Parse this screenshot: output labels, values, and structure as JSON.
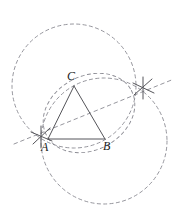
{
  "figure": {
    "width": 177,
    "height": 222,
    "background_color": "#ffffff",
    "stroke_color_solid": "#55555a",
    "stroke_color_dashed": "#8a8a92",
    "label_color": "#1a1a1a"
  },
  "labels": {
    "a": "A",
    "b": "B",
    "c": "C"
  },
  "points": {
    "A": {
      "x": 48,
      "y": 139,
      "label": "A"
    },
    "B": {
      "x": 105,
      "y": 139,
      "label": "B"
    },
    "C": {
      "x": 74,
      "y": 86,
      "label": "C"
    }
  },
  "markers": {
    "left_cross": {
      "x": 41,
      "y": 136,
      "label": ""
    },
    "right_cross": {
      "x": 143,
      "y": 88,
      "label": ""
    }
  },
  "circles": [
    {
      "name": "arc-centered-at-C",
      "cx": 74,
      "cy": 86,
      "r": 62
    },
    {
      "name": "arc-centered-at-B",
      "cx": 104,
      "cy": 141,
      "r": 63
    },
    {
      "name": "arc-through-A-B-C",
      "cx": 88,
      "cy": 112,
      "r": 41
    }
  ],
  "lines": [
    {
      "name": "side-AB",
      "x1": 48,
      "y1": 139,
      "x2": 105,
      "y2": 139,
      "style": "solid"
    },
    {
      "name": "side-AC",
      "x1": 48,
      "y1": 139,
      "x2": 74,
      "y2": 86,
      "style": "solid"
    },
    {
      "name": "side-BC",
      "x1": 105,
      "y1": 139,
      "x2": 74,
      "y2": 86,
      "style": "solid"
    },
    {
      "name": "construction-line-cross-to-cross",
      "x1": 16,
      "y1": 143,
      "x2": 172,
      "y2": 80,
      "style": "dashed"
    }
  ],
  "label_positions": {
    "A": {
      "left": 41,
      "top": 142
    },
    "B": {
      "left": 102,
      "top": 141
    },
    "C": {
      "left": 67,
      "top": 71
    }
  }
}
